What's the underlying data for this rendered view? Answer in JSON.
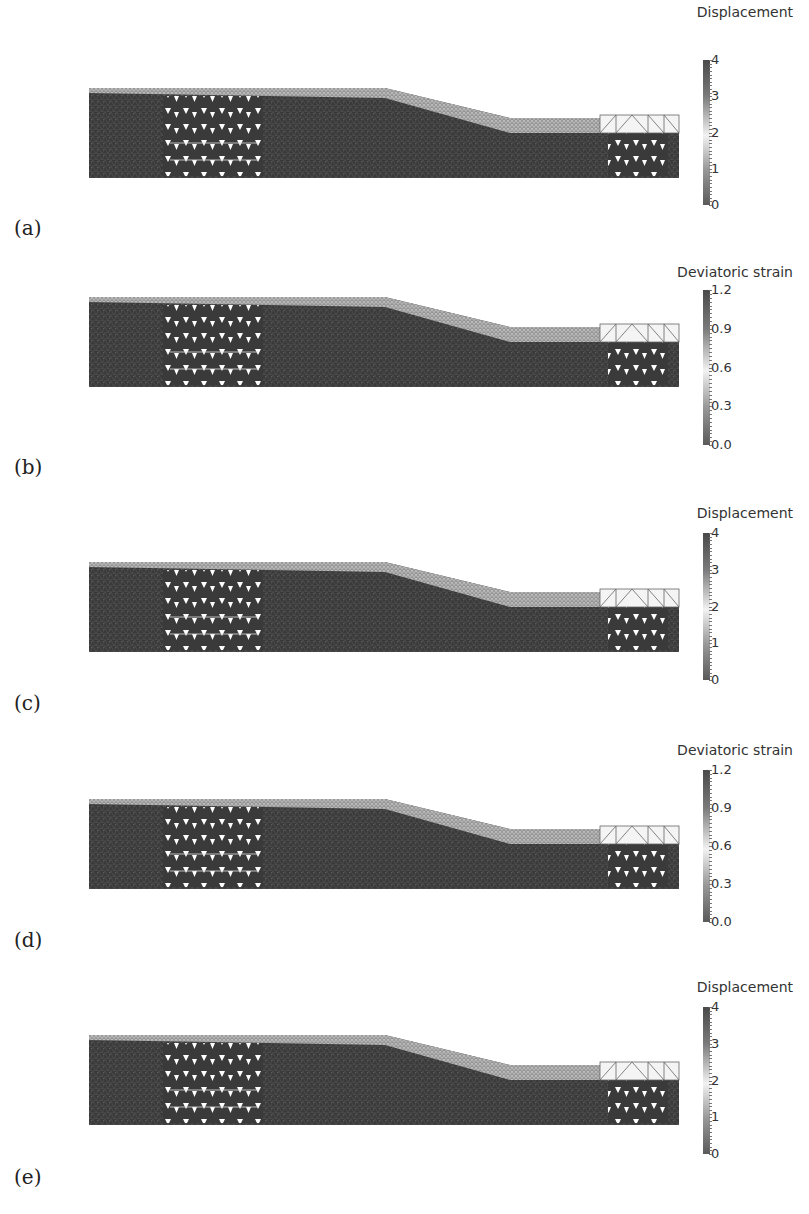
{
  "figure": {
    "panels": [
      {
        "label": "(a)",
        "quantity": "Displacement",
        "ticks": [
          "4",
          "3",
          "2",
          "1",
          "0"
        ],
        "mesh_top": 88,
        "legend_top": 4,
        "bar_top": 60,
        "bar_height": 145,
        "label_top": 216
      },
      {
        "label": "(b)",
        "quantity": "Deviatoric strain",
        "ticks": [
          "1.2",
          "0.9",
          "0.6",
          "0.3",
          "0.0"
        ],
        "mesh_top": 297,
        "legend_top": 264,
        "bar_top": 290,
        "bar_height": 155,
        "label_top": 455
      },
      {
        "label": "(c)",
        "quantity": "Displacement",
        "ticks": [
          "4",
          "3",
          "2",
          "1",
          "0"
        ],
        "mesh_top": 562,
        "legend_top": 505,
        "bar_top": 533,
        "bar_height": 147,
        "label_top": 691
      },
      {
        "label": "(d)",
        "quantity": "Deviatoric strain",
        "ticks": [
          "1.2",
          "0.9",
          "0.6",
          "0.3",
          "0.0"
        ],
        "mesh_top": 799,
        "legend_top": 742,
        "bar_top": 770,
        "bar_height": 152,
        "label_top": 928
      },
      {
        "label": "(e)",
        "quantity": "Displacement",
        "ticks": [
          "4",
          "3",
          "2",
          "1",
          "0"
        ],
        "mesh_top": 1035,
        "legend_top": 979,
        "bar_top": 1007,
        "bar_height": 147,
        "label_top": 1165
      }
    ]
  },
  "chart_data": {
    "type": "heatmap",
    "panels": [
      {
        "id": "a",
        "field": "Displacement",
        "colorbar_range": [
          0,
          4
        ],
        "colorbar_ticks": [
          0,
          1,
          2,
          3,
          4
        ]
      },
      {
        "id": "b",
        "field": "Deviatoric strain",
        "colorbar_range": [
          0.0,
          1.2
        ],
        "colorbar_ticks": [
          0.0,
          0.3,
          0.6,
          0.9,
          1.2
        ]
      },
      {
        "id": "c",
        "field": "Displacement",
        "colorbar_range": [
          0,
          4
        ],
        "colorbar_ticks": [
          0,
          1,
          2,
          3,
          4
        ]
      },
      {
        "id": "d",
        "field": "Deviatoric strain",
        "colorbar_range": [
          0.0,
          1.2
        ],
        "colorbar_ticks": [
          0.0,
          0.3,
          0.6,
          0.9,
          1.2
        ]
      },
      {
        "id": "e",
        "field": "Displacement",
        "colorbar_range": [
          0,
          4
        ],
        "colorbar_ticks": [
          0,
          1,
          2,
          3,
          4
        ]
      }
    ]
  },
  "colors": {
    "mesh_dark": "#3a3a3a",
    "mesh_light": "#c8c8c8",
    "background": "#ffffff"
  }
}
